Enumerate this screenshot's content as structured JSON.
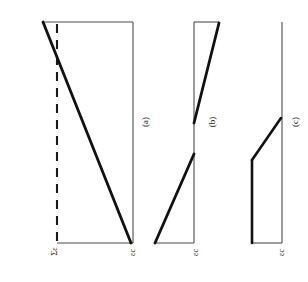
{
  "figure": {
    "background_color": "#ffffff",
    "line_color": "#1a1a1a",
    "thick_line_color": "#111111",
    "thin_line_color": "#4d4d4d",
    "dashed_line_color": "#1a1a1a"
  },
  "panels": [
    {
      "id": "a",
      "caption": "(a)",
      "description": "Linear strain distribution crossing the neutral axis, with dashed reference line",
      "axis_labels": {
        "left": "Σε",
        "left_base": "Σ",
        "left_sub": "ε",
        "right": "εc",
        "right_base": "ε",
        "right_sub": "c"
      },
      "geometry": {
        "top_y": 22,
        "bottom_y": 243,
        "left_x": 43,
        "right_x": 133,
        "dashed_x": 57,
        "profile_start": [
          43,
          22
        ],
        "profile_end": [
          131,
          243
        ]
      }
    },
    {
      "id": "b",
      "caption": "(b)",
      "description": "Discontinuous bilinear strain distribution with vertical jump at mid-height",
      "axis_labels": {
        "bottom": "εc",
        "bottom_base": "ε",
        "bottom_sub": "c"
      },
      "geometry": {
        "top_y": 22,
        "bottom_y": 243,
        "axis_x": 194,
        "top_right_x": 219,
        "upper_kink": [
          194,
          122
        ],
        "lower_kink": [
          194,
          155
        ],
        "bottom_left_x": 155
      }
    },
    {
      "id": "c",
      "caption": "(c)",
      "description": "Constant then linearly varying strain distribution meeting the axis",
      "axis_labels": {
        "bottom": "εc",
        "bottom_base": "ε",
        "bottom_sub": "c"
      },
      "geometry": {
        "top_y": 22,
        "bottom_y": 243,
        "axis_x": 282,
        "block_x": 252,
        "kink": [
          252,
          160
        ],
        "meet_point": [
          281,
          118
        ]
      }
    }
  ],
  "captions": {
    "a": "(a)",
    "b": "(b)",
    "c": "(c)"
  },
  "labels": {
    "sigma_epsilon": "Σε",
    "epsilon_c_a": "εc",
    "epsilon_c_b": "εc",
    "epsilon_c_c": "εc"
  }
}
